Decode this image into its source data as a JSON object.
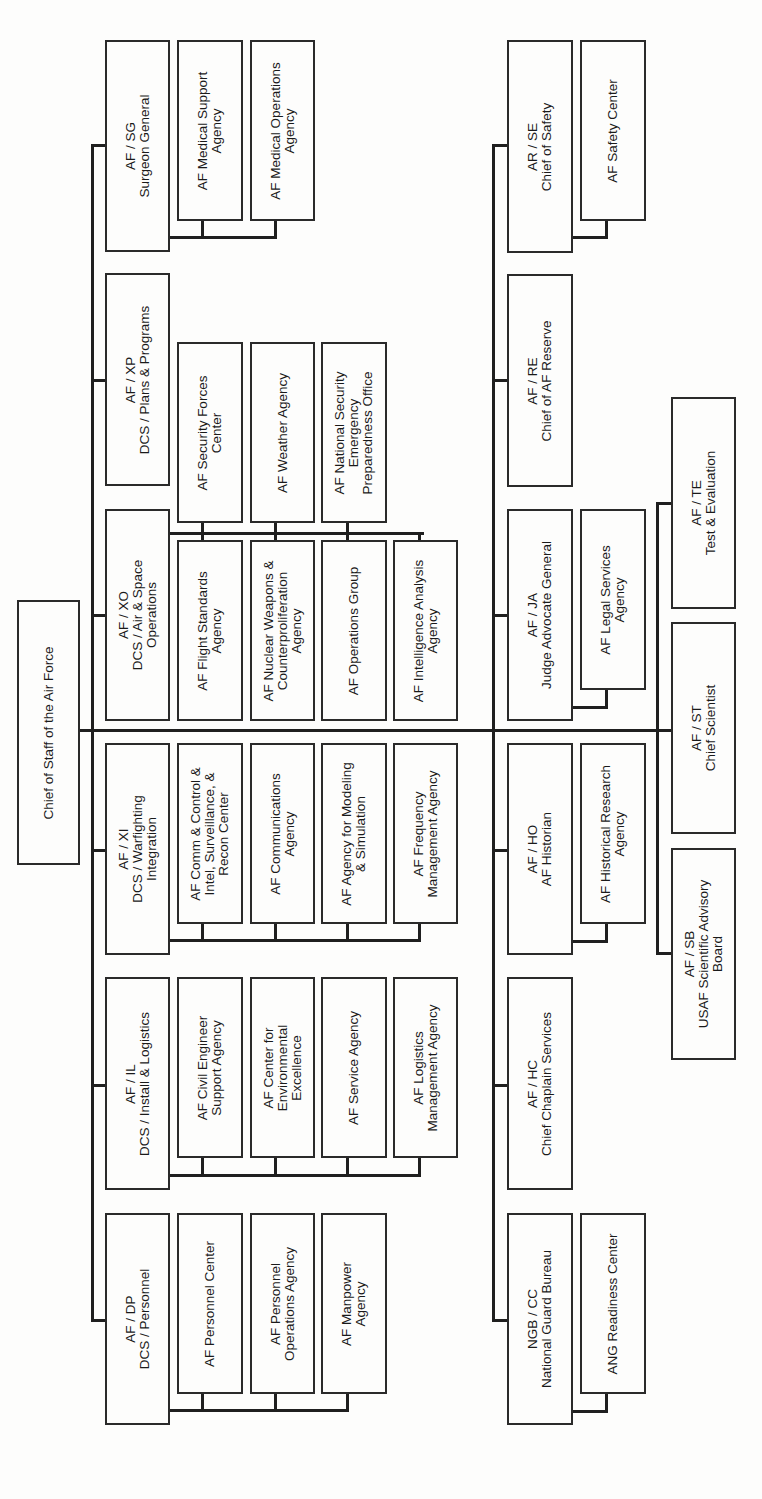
{
  "chart": {
    "title": "Chief of Staff of the Air Force",
    "orientation": "rotated-90-ccw",
    "root": {
      "id": "chief",
      "label": "Chief of Staff of the Air Force"
    },
    "boxes": [
      {
        "id": "chief",
        "label": "Chief of Staff of the Air Force",
        "x": 17,
        "y": 600,
        "w": 63,
        "h": 265
      },
      {
        "id": "sg",
        "label": "AF / SG\nSurgeon General",
        "x": 105,
        "y": 40,
        "w": 65,
        "h": 212
      },
      {
        "id": "sg-msa",
        "label": "AF Medical Support\nAgency",
        "x": 177,
        "y": 40,
        "w": 66,
        "h": 181
      },
      {
        "id": "sg-moa",
        "label": "AF Medical Operations\nAgency",
        "x": 250,
        "y": 40,
        "w": 65,
        "h": 181
      },
      {
        "id": "xp",
        "label": "AF / XP\nDCS / Plans & Programs",
        "x": 105,
        "y": 273,
        "w": 65,
        "h": 213
      },
      {
        "id": "xo-sfc",
        "label": "AF Security Forces\nCenter",
        "x": 177,
        "y": 342,
        "w": 66,
        "h": 181
      },
      {
        "id": "xo-wx",
        "label": "AF Weather Agency",
        "x": 250,
        "y": 342,
        "w": 65,
        "h": 181
      },
      {
        "id": "xo-nsepo",
        "label": "AF National Security\nEmergency\nPreparedness Office",
        "x": 321,
        "y": 342,
        "w": 66,
        "h": 181
      },
      {
        "id": "xo",
        "label": "AF / XO\nDCS / Air & Space\nOperations",
        "x": 105,
        "y": 509,
        "w": 65,
        "h": 212
      },
      {
        "id": "xo-fsa",
        "label": "AF Flight Standards\nAgency",
        "x": 177,
        "y": 540,
        "w": 66,
        "h": 181
      },
      {
        "id": "xo-nwca",
        "label": "AF Nuclear Weapons &\nCounterproliferation\nAgency",
        "x": 250,
        "y": 540,
        "w": 65,
        "h": 181
      },
      {
        "id": "xo-og",
        "label": "AF Operations Group",
        "x": 321,
        "y": 540,
        "w": 66,
        "h": 181
      },
      {
        "id": "xo-iaa",
        "label": "AF Intelligence Analysis\nAgency",
        "x": 393,
        "y": 540,
        "w": 65,
        "h": 181
      },
      {
        "id": "xi",
        "label": "AF / XI\nDCS / Warfighting\nIntegration",
        "x": 105,
        "y": 743,
        "w": 65,
        "h": 212
      },
      {
        "id": "xi-c2isr",
        "label": "AF Comm & Control &\nIntel, Surveillance, &\nRecon Center",
        "x": 177,
        "y": 743,
        "w": 66,
        "h": 181
      },
      {
        "id": "xi-ca",
        "label": "AF Communications\nAgency",
        "x": 250,
        "y": 743,
        "w": 65,
        "h": 181
      },
      {
        "id": "xi-ams",
        "label": "AF Agency for Modeling\n& Simulation",
        "x": 321,
        "y": 743,
        "w": 66,
        "h": 181
      },
      {
        "id": "xi-fma",
        "label": "AF Frequency\nManagement Agency",
        "x": 393,
        "y": 743,
        "w": 65,
        "h": 181
      },
      {
        "id": "il",
        "label": "AF / IL\nDCS / Install & Logistics",
        "x": 105,
        "y": 977,
        "w": 65,
        "h": 213
      },
      {
        "id": "il-cesa",
        "label": "AF Civil Engineer\nSupport Agency",
        "x": 177,
        "y": 977,
        "w": 66,
        "h": 181
      },
      {
        "id": "il-cee",
        "label": "AF Center for\nEnvironmental\nExcellence",
        "x": 250,
        "y": 977,
        "w": 65,
        "h": 181
      },
      {
        "id": "il-sa",
        "label": "AF Service Agency",
        "x": 321,
        "y": 977,
        "w": 66,
        "h": 181
      },
      {
        "id": "il-lma",
        "label": "AF Logistics\nManagement Agency",
        "x": 393,
        "y": 977,
        "w": 65,
        "h": 181
      },
      {
        "id": "dp",
        "label": "AF / DP\nDCS / Personnel",
        "x": 105,
        "y": 1213,
        "w": 65,
        "h": 212
      },
      {
        "id": "dp-pc",
        "label": "AF Personnel Center",
        "x": 177,
        "y": 1213,
        "w": 66,
        "h": 181
      },
      {
        "id": "dp-poa",
        "label": "AF Personnel\nOperations Agency",
        "x": 250,
        "y": 1213,
        "w": 65,
        "h": 181
      },
      {
        "id": "dp-ma",
        "label": "AF Manpower\nAgency",
        "x": 321,
        "y": 1213,
        "w": 66,
        "h": 181
      },
      {
        "id": "se",
        "label": "AR / SE\nChief of Safety",
        "x": 507,
        "y": 40,
        "w": 66,
        "h": 213
      },
      {
        "id": "se-sc",
        "label": "AF Safety Center",
        "x": 580,
        "y": 40,
        "w": 66,
        "h": 181
      },
      {
        "id": "re",
        "label": "AF / RE\nChief of AF Reserve",
        "x": 507,
        "y": 274,
        "w": 66,
        "h": 213
      },
      {
        "id": "ja",
        "label": "AF / JA\nJudge Advocate General",
        "x": 507,
        "y": 509,
        "w": 66,
        "h": 212
      },
      {
        "id": "ja-lsa",
        "label": "AF Legal Services\nAgency",
        "x": 580,
        "y": 509,
        "w": 66,
        "h": 181
      },
      {
        "id": "ho",
        "label": "AF / HO\nAF Historian",
        "x": 507,
        "y": 743,
        "w": 66,
        "h": 212
      },
      {
        "id": "ho-hra",
        "label": "AF Historical Research\nAgency",
        "x": 580,
        "y": 743,
        "w": 66,
        "h": 181
      },
      {
        "id": "hc",
        "label": "AF / HC\nChief Chaplain Services",
        "x": 507,
        "y": 977,
        "w": 66,
        "h": 213
      },
      {
        "id": "ngb",
        "label": "NGB / CC\nNational Guard Bureau",
        "x": 507,
        "y": 1213,
        "w": 66,
        "h": 212
      },
      {
        "id": "ngb-arc",
        "label": "ANG Readiness Center",
        "x": 580,
        "y": 1213,
        "w": 66,
        "h": 181
      },
      {
        "id": "te",
        "label": "AF / TE\nTest & Evaluation",
        "x": 671,
        "y": 397,
        "w": 65,
        "h": 212
      },
      {
        "id": "st",
        "label": "AF / ST\nChief Scientist",
        "x": 671,
        "y": 622,
        "w": 65,
        "h": 212
      },
      {
        "id": "sb",
        "label": "AF / SB\nUSAF Scientific Advisory\nBoard",
        "x": 671,
        "y": 848,
        "w": 65,
        "h": 212
      }
    ],
    "lines": [
      {
        "x": 79,
        "y": 729,
        "w": 596,
        "h": 3
      },
      {
        "x": 91,
        "y": 144,
        "w": 3,
        "h": 1178
      },
      {
        "x": 91,
        "y": 144,
        "w": 15,
        "h": 3
      },
      {
        "x": 91,
        "y": 379,
        "w": 15,
        "h": 3
      },
      {
        "x": 91,
        "y": 614,
        "w": 15,
        "h": 3
      },
      {
        "x": 91,
        "y": 849,
        "w": 15,
        "h": 3
      },
      {
        "x": 91,
        "y": 1084,
        "w": 15,
        "h": 3
      },
      {
        "x": 91,
        "y": 1319,
        "w": 15,
        "h": 3
      },
      {
        "x": 169,
        "y": 236,
        "w": 108,
        "h": 3
      },
      {
        "x": 201,
        "y": 220,
        "w": 3,
        "h": 17
      },
      {
        "x": 274,
        "y": 220,
        "w": 3,
        "h": 17
      },
      {
        "x": 169,
        "y": 532,
        "w": 255,
        "h": 3
      },
      {
        "x": 201,
        "y": 523,
        "w": 3,
        "h": 17
      },
      {
        "x": 274,
        "y": 523,
        "w": 3,
        "h": 17
      },
      {
        "x": 346,
        "y": 523,
        "w": 3,
        "h": 17
      },
      {
        "x": 418,
        "y": 532,
        "w": 3,
        "h": 8
      },
      {
        "x": 169,
        "y": 939,
        "w": 252,
        "h": 3
      },
      {
        "x": 201,
        "y": 923,
        "w": 3,
        "h": 17
      },
      {
        "x": 274,
        "y": 923,
        "w": 3,
        "h": 17
      },
      {
        "x": 346,
        "y": 923,
        "w": 3,
        "h": 17
      },
      {
        "x": 418,
        "y": 923,
        "w": 3,
        "h": 17
      },
      {
        "x": 169,
        "y": 1174,
        "w": 252,
        "h": 3
      },
      {
        "x": 201,
        "y": 1158,
        "w": 3,
        "h": 17
      },
      {
        "x": 274,
        "y": 1158,
        "w": 3,
        "h": 17
      },
      {
        "x": 346,
        "y": 1158,
        "w": 3,
        "h": 17
      },
      {
        "x": 418,
        "y": 1158,
        "w": 3,
        "h": 17
      },
      {
        "x": 169,
        "y": 1409,
        "w": 180,
        "h": 3
      },
      {
        "x": 201,
        "y": 1393,
        "w": 3,
        "h": 17
      },
      {
        "x": 274,
        "y": 1393,
        "w": 3,
        "h": 17
      },
      {
        "x": 346,
        "y": 1393,
        "w": 3,
        "h": 17
      },
      {
        "x": 492,
        "y": 144,
        "w": 3,
        "h": 1178
      },
      {
        "x": 492,
        "y": 144,
        "w": 15,
        "h": 3
      },
      {
        "x": 492,
        "y": 379,
        "w": 15,
        "h": 3
      },
      {
        "x": 492,
        "y": 614,
        "w": 15,
        "h": 3
      },
      {
        "x": 492,
        "y": 849,
        "w": 15,
        "h": 3
      },
      {
        "x": 492,
        "y": 1084,
        "w": 15,
        "h": 3
      },
      {
        "x": 492,
        "y": 1319,
        "w": 15,
        "h": 3
      },
      {
        "x": 572,
        "y": 236,
        "w": 36,
        "h": 3
      },
      {
        "x": 605,
        "y": 220,
        "w": 3,
        "h": 17
      },
      {
        "x": 572,
        "y": 706,
        "w": 36,
        "h": 3
      },
      {
        "x": 605,
        "y": 690,
        "w": 3,
        "h": 17
      },
      {
        "x": 572,
        "y": 940,
        "w": 36,
        "h": 3
      },
      {
        "x": 605,
        "y": 923,
        "w": 3,
        "h": 18
      },
      {
        "x": 572,
        "y": 1410,
        "w": 36,
        "h": 3
      },
      {
        "x": 605,
        "y": 1393,
        "w": 3,
        "h": 18
      },
      {
        "x": 656,
        "y": 502,
        "w": 3,
        "h": 453
      },
      {
        "x": 656,
        "y": 502,
        "w": 15,
        "h": 3
      },
      {
        "x": 656,
        "y": 952,
        "w": 15,
        "h": 3
      }
    ]
  }
}
